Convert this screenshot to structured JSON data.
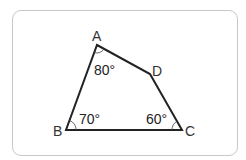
{
  "figure": {
    "type": "quadrilateral",
    "vertices": {
      "A": {
        "label": "A",
        "x": 97,
        "y": 45
      },
      "B": {
        "label": "B",
        "x": 66,
        "y": 130
      },
      "C": {
        "label": "C",
        "x": 182,
        "y": 130
      },
      "D": {
        "label": "D",
        "x": 150,
        "y": 74
      }
    },
    "angles": {
      "A": "80°",
      "B": "70°",
      "C": "60°"
    },
    "colors": {
      "stroke": "#222222",
      "frame": "#c8c8c8",
      "text": "#333333"
    }
  }
}
